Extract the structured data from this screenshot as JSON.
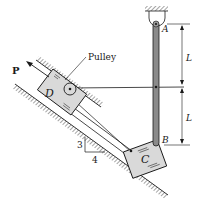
{
  "diagram": {
    "labels": {
      "pulley": "Pulley",
      "force": "P",
      "block_d": "D",
      "block_c": "C",
      "point_a": "A",
      "point_b": "B",
      "dim_upper": "L",
      "dim_lower": "L",
      "slope_rise": "3",
      "slope_run": "4"
    },
    "colors": {
      "line": "#1a1a1a",
      "rod": "#8a8a8a",
      "block": "#d9d9d9"
    }
  }
}
